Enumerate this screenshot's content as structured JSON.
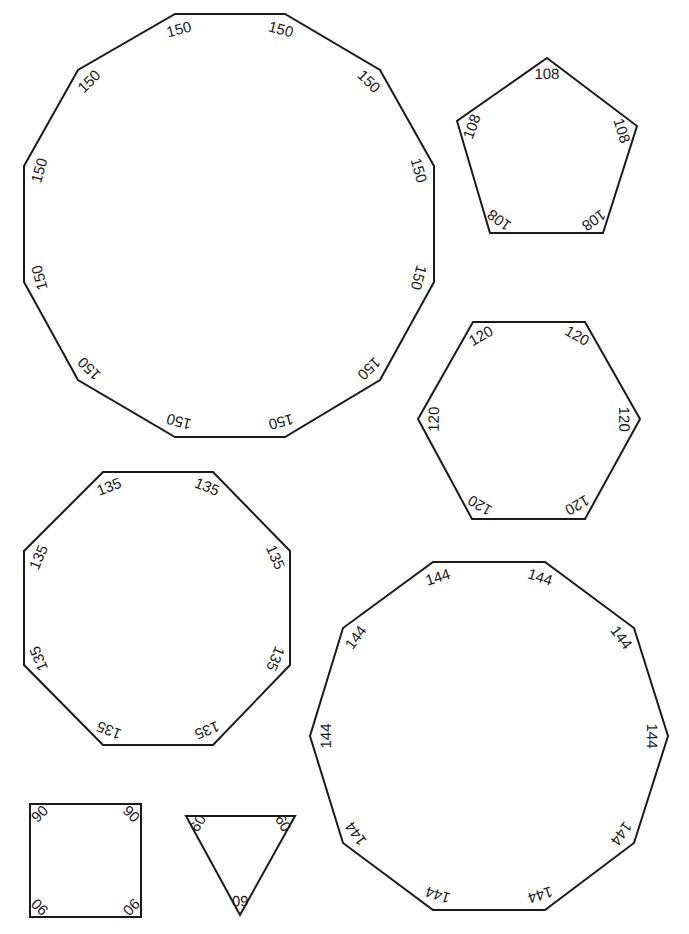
{
  "colors": {
    "stroke": "#1a1a1a",
    "background": "#ffffff"
  },
  "shapes": [
    {
      "name": "dodecagon",
      "sides": 12,
      "angle_label": "150",
      "vertices": [
        [
          175,
          14
        ],
        [
          285,
          14
        ],
        [
          380,
          70
        ],
        [
          434,
          166
        ],
        [
          434,
          282
        ],
        [
          380,
          380
        ],
        [
          285,
          437
        ],
        [
          175,
          437
        ],
        [
          78,
          380
        ],
        [
          24,
          282
        ],
        [
          24,
          166
        ],
        [
          78,
          70
        ]
      ]
    },
    {
      "name": "pentagon",
      "sides": 5,
      "angle_label": "108",
      "vertices": [
        [
          547,
          58
        ],
        [
          637,
          126
        ],
        [
          603,
          233
        ],
        [
          490,
          233
        ],
        [
          457,
          121
        ]
      ]
    },
    {
      "name": "hexagon",
      "sides": 6,
      "angle_label": "120",
      "vertices": [
        [
          473,
          322
        ],
        [
          585,
          322
        ],
        [
          640,
          419
        ],
        [
          585,
          519
        ],
        [
          472,
          519
        ],
        [
          418,
          419
        ]
      ]
    },
    {
      "name": "octagon",
      "sides": 8,
      "angle_label": "135",
      "vertices": [
        [
          103,
          472
        ],
        [
          213,
          472
        ],
        [
          290,
          551
        ],
        [
          290,
          665
        ],
        [
          213,
          745
        ],
        [
          103,
          745
        ],
        [
          24,
          665
        ],
        [
          24,
          551
        ]
      ]
    },
    {
      "name": "decagon",
      "sides": 10,
      "angle_label": "144",
      "vertices": [
        [
          433,
          562
        ],
        [
          545,
          562
        ],
        [
          634,
          628
        ],
        [
          668,
          736
        ],
        [
          634,
          843
        ],
        [
          545,
          910
        ],
        [
          433,
          910
        ],
        [
          343,
          843
        ],
        [
          310,
          736
        ],
        [
          343,
          628
        ]
      ]
    },
    {
      "name": "square",
      "sides": 4,
      "angle_label": "90",
      "vertices": [
        [
          30,
          804
        ],
        [
          141,
          804
        ],
        [
          141,
          917
        ],
        [
          30,
          917
        ]
      ]
    },
    {
      "name": "triangle",
      "sides": 3,
      "angle_label": "60",
      "vertices": [
        [
          186,
          816
        ],
        [
          295,
          816
        ],
        [
          240,
          915
        ]
      ]
    }
  ]
}
